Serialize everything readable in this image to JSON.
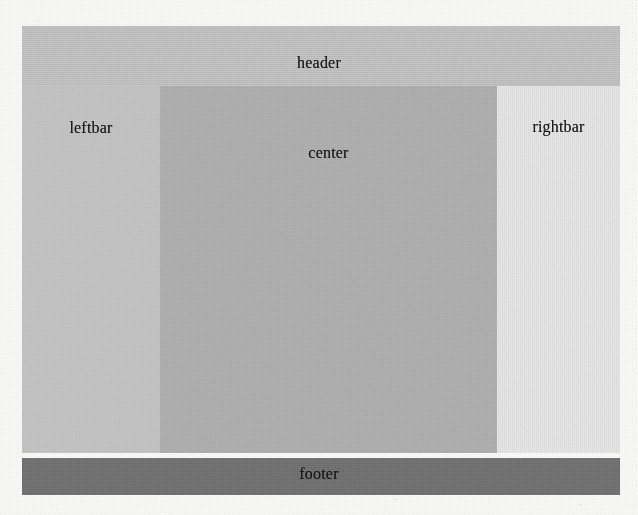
{
  "diagram": {
    "type": "block-layout-schematic",
    "regions": [
      {
        "key": "header",
        "label": "header",
        "color": "#c6c6c6",
        "x": 22,
        "y": 26,
        "width": 598,
        "height": 60
      },
      {
        "key": "leftbar",
        "label": "leftbar",
        "color": "#c9c9c9",
        "x": 22,
        "y": 86,
        "width": 138,
        "height": 367
      },
      {
        "key": "center",
        "label": "center",
        "color": "#b2b2b2",
        "x": 160,
        "y": 86,
        "width": 337,
        "height": 367
      },
      {
        "key": "rightbar",
        "label": "rightbar",
        "color": "#ececec",
        "x": 497,
        "y": 86,
        "width": 123,
        "height": 367
      },
      {
        "key": "footer",
        "label": "footer",
        "color": "#6f6f6f",
        "x": 22,
        "y": 458,
        "width": 598,
        "height": 37
      }
    ],
    "page_background": "#fbfbfa",
    "label_color": "#17171a"
  }
}
